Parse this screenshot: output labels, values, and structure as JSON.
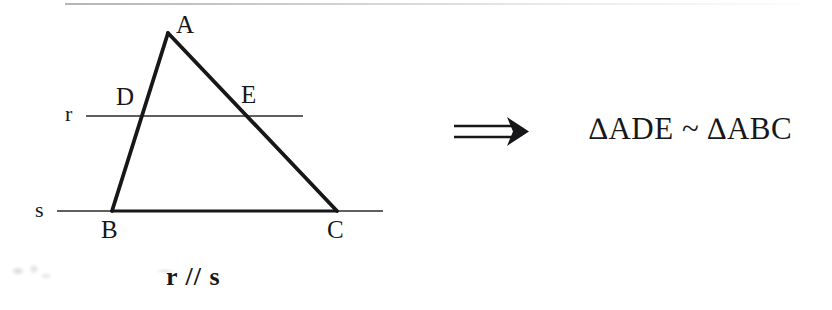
{
  "figure": {
    "type": "geometry-diagram",
    "topic": "Basic proportionality / similar triangles",
    "background_color": "#ffffff",
    "ink_color": "#17171a"
  },
  "diagram": {
    "triangle": {
      "name": "ABC",
      "vertices": [
        {
          "label": "A",
          "x": 168,
          "y": 33
        },
        {
          "label": "B",
          "x": 112,
          "y": 211
        },
        {
          "label": "C",
          "x": 337,
          "y": 211
        }
      ],
      "stroke_width": 3.6
    },
    "lines": [
      {
        "label": "r",
        "description": "transversal parallel to s, cuts AB at D and AC at E",
        "x1": 86,
        "y1": 116,
        "x2": 303,
        "y2": 116,
        "stroke_width": 1.6
      },
      {
        "label": "s",
        "description": "line containing base BC",
        "x1": 57,
        "y1": 211,
        "x2": 383,
        "y2": 211,
        "stroke_width": 1.6
      }
    ],
    "intersection_points": [
      {
        "label": "D",
        "on": "AB",
        "x": 140,
        "y": 116
      },
      {
        "label": "E",
        "on": "AC",
        "x": 244,
        "y": 116
      }
    ],
    "vertex_labels": {
      "A": "A",
      "B": "B",
      "C": "C",
      "D": "D",
      "E": "E"
    },
    "line_labels": {
      "r": "r",
      "s": "s"
    },
    "caption": "r // s"
  },
  "implication": {
    "symbol": "⟹",
    "symbol_name": "double-right-arrow",
    "conclusion": "∆ADE ~ ∆ABC"
  }
}
